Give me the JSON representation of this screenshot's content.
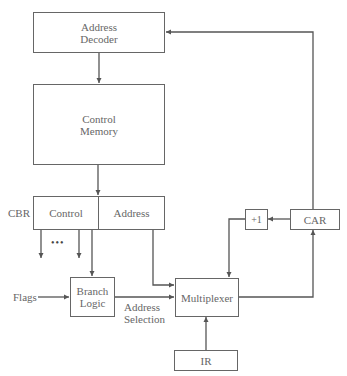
{
  "diagram": {
    "blocks": {
      "address_decoder": {
        "line1": "Address",
        "line2": "Decoder"
      },
      "control_memory": {
        "line1": "Control",
        "line2": "Memory"
      },
      "cbr": {
        "label": "CBR",
        "control": "Control",
        "address": "Address"
      },
      "branch_logic": {
        "line1": "Branch",
        "line2": "Logic"
      },
      "multiplexer": {
        "label": "Multiplexer"
      },
      "ir": {
        "label": "IR"
      },
      "incrementer": {
        "label": "+1"
      },
      "car": {
        "label": "CAR"
      }
    },
    "labels": {
      "flags": "Flags",
      "address_selection_1": "Address",
      "address_selection_2": "Selection",
      "ellipsis": "•••"
    },
    "edges": [
      {
        "from": "address_decoder",
        "to": "control_memory"
      },
      {
        "from": "control_memory",
        "to": "cbr"
      },
      {
        "from": "cbr.control",
        "to": "control_outputs"
      },
      {
        "from": "cbr.control",
        "to": "branch_logic"
      },
      {
        "from": "cbr.address",
        "to": "multiplexer"
      },
      {
        "from": "flags",
        "to": "branch_logic"
      },
      {
        "from": "branch_logic",
        "to": "multiplexer",
        "label": "Address Selection"
      },
      {
        "from": "ir",
        "to": "multiplexer"
      },
      {
        "from": "multiplexer",
        "to": "car"
      },
      {
        "from": "car",
        "to": "incrementer"
      },
      {
        "from": "incrementer",
        "to": "multiplexer"
      },
      {
        "from": "car",
        "to": "address_decoder"
      }
    ]
  }
}
